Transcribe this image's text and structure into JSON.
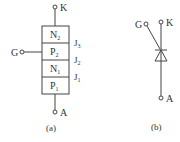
{
  "diagram_a": {
    "terminals": {
      "cathode": "K",
      "gate": "G",
      "anode": "A"
    },
    "layers": [
      {
        "main": "N",
        "sub": "2"
      },
      {
        "main": "P",
        "sub": "2"
      },
      {
        "main": "N",
        "sub": "1"
      },
      {
        "main": "P",
        "sub": "1"
      }
    ],
    "junctions": [
      {
        "main": "J",
        "sub": "3"
      },
      {
        "main": "J",
        "sub": "2"
      },
      {
        "main": "J",
        "sub": "1"
      }
    ],
    "caption": "(a)"
  },
  "diagram_b": {
    "terminals": {
      "cathode": "K",
      "gate": "G",
      "anode": "A"
    },
    "caption": "(b)"
  },
  "colors": {
    "line": "#444444",
    "text": "#333333",
    "background": "#ffffff"
  }
}
